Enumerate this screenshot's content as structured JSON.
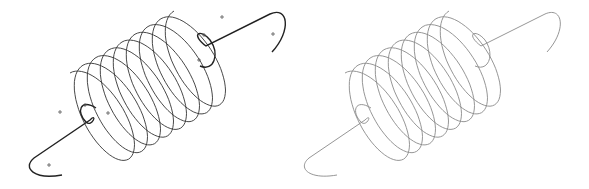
{
  "diagram": {
    "type": "coil-spring-comparison",
    "panels": [
      {
        "id": "left",
        "description": "Coil spring with control points",
        "stroke": "#333333",
        "hook_stroke": "#222222",
        "offset_x": 0,
        "offset_y": 0,
        "scale": 1.0,
        "show_control_points": true
      },
      {
        "id": "right",
        "description": "Coil spring rendered curve",
        "stroke": "#8a8a8a",
        "hook_stroke": "#8a8a8a",
        "offset_x": 275,
        "offset_y": 0,
        "scale": 1.0,
        "show_control_points": false
      }
    ],
    "coil": {
      "turns": 8,
      "start": [
        96,
        118
      ],
      "end": [
        200,
        56
      ],
      "rx": 24,
      "ry": 52,
      "rotation_deg": -30
    },
    "control_points": [
      [
        60,
        112
      ],
      [
        85,
        105
      ],
      [
        108,
        113
      ],
      [
        49,
        165
      ],
      [
        222,
        17
      ],
      [
        204,
        35
      ],
      [
        199,
        60
      ],
      [
        273,
        34
      ]
    ],
    "background": "#ffffff"
  }
}
